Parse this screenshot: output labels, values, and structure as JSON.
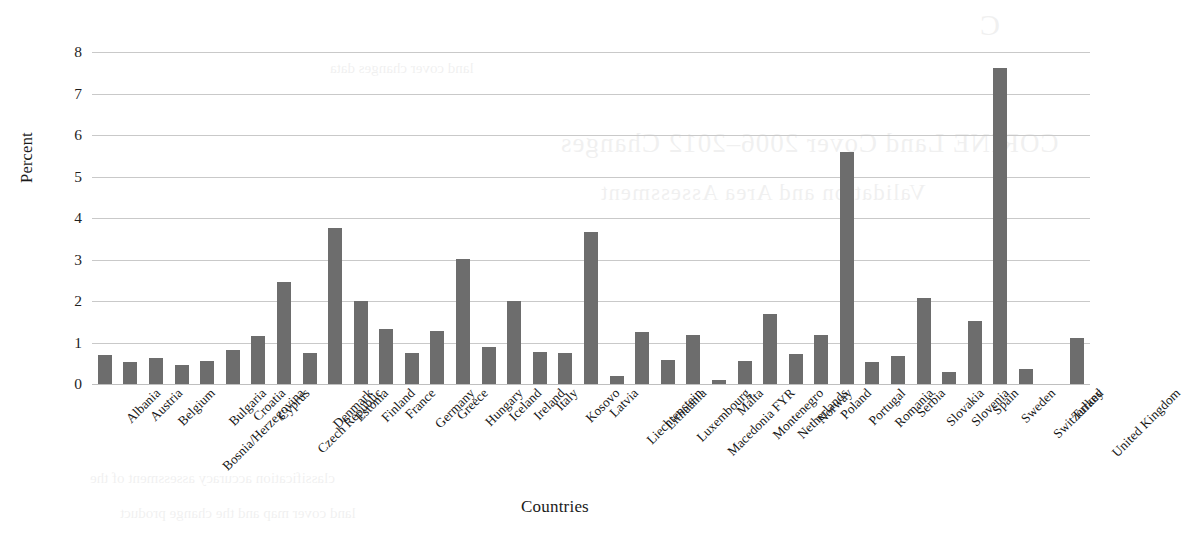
{
  "chart_data": {
    "type": "bar",
    "title": "",
    "xlabel": "Countries",
    "ylabel": "Percent",
    "ylim": [
      0,
      8
    ],
    "yticks": [
      0,
      1,
      2,
      3,
      4,
      5,
      6,
      7,
      8
    ],
    "grid": true,
    "legend": "none",
    "bar_color": "#6d6d6d",
    "categories": [
      "Albania",
      "Austria",
      "Belgium",
      "Bosnia/Herzegovina",
      "Bulgaria",
      "Croatia",
      "Cyprus",
      "Czech Republic",
      "Denmark",
      "Estonia",
      "Finland",
      "France",
      "Germany",
      "Greece",
      "Hungary",
      "Iceland",
      "Ireland",
      "Italy",
      "Kosovo",
      "Latvia",
      "Liechtenstein",
      "Lithuania",
      "Luxembourg",
      "Macedonia FYR",
      "Malta",
      "Montenegro",
      "Netherlands",
      "Norway",
      "Poland",
      "Portugal",
      "Romania",
      "Serbia",
      "Slovakia",
      "Slovenia",
      "Spain",
      "Sweden",
      "Switzerland",
      "Turkey",
      "United Kingdom"
    ],
    "values": [
      0.7,
      0.52,
      0.62,
      0.47,
      0.55,
      0.83,
      1.15,
      2.45,
      0.75,
      3.77,
      2.0,
      1.32,
      0.74,
      1.27,
      3.02,
      0.88,
      2.01,
      0.76,
      0.75,
      3.67,
      0.2,
      1.25,
      0.58,
      1.18,
      0.1,
      0.55,
      1.68,
      0.73,
      1.17,
      5.58,
      0.52,
      0.68,
      2.08,
      0.28,
      1.52,
      7.62,
      0.35,
      0.0,
      1.1
    ]
  }
}
